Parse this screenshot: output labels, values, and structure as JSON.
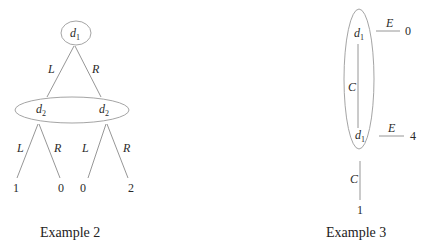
{
  "examples": [
    {
      "caption": "Example 2",
      "root": {
        "label": "d",
        "sub": "1"
      },
      "edges_top": {
        "left": "L",
        "right": "R"
      },
      "info_set": {
        "nodes": [
          {
            "label": "d",
            "sub": "2"
          },
          {
            "label": "d",
            "sub": "2"
          }
        ]
      },
      "left_node": {
        "edges": {
          "left": "L",
          "right": "R"
        },
        "payoffs": [
          "1",
          "0"
        ]
      },
      "right_node": {
        "edges": {
          "left": "L",
          "right": "R"
        },
        "payoffs": [
          "0",
          "2"
        ]
      }
    },
    {
      "caption": "Example 3",
      "info_set": {
        "nodes": [
          {
            "label": "d",
            "sub": "1",
            "exit_action": "E",
            "exit_payoff": "0"
          },
          {
            "label": "d",
            "sub": "1",
            "exit_action": "E",
            "exit_payoff": "4"
          }
        ]
      },
      "continue_label_inner": "C",
      "continue_label_outer": "C",
      "terminal_payoff": "1"
    }
  ]
}
